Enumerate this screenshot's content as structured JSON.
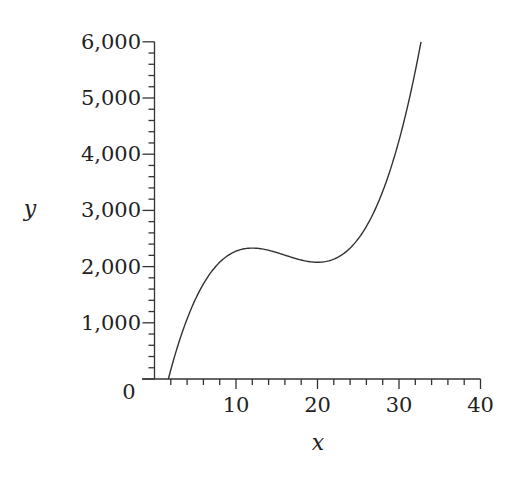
{
  "chart_data": {
    "type": "line",
    "title": "",
    "xlabel": "x",
    "ylabel": "y",
    "xlim": [
      0,
      40
    ],
    "ylim": [
      0,
      6000
    ],
    "grid": false,
    "legend": null,
    "x_ticks": [
      10,
      20,
      30,
      40
    ],
    "x_tick_labels": [
      "10",
      "20",
      "30",
      "40"
    ],
    "x_minor_step": 2,
    "y_ticks": [
      0,
      1000,
      2000,
      3000,
      4000,
      5000,
      6000
    ],
    "y_tick_labels": [
      "0",
      "1,000",
      "2,000",
      "3,000",
      "4,000",
      "5,000",
      "6,000"
    ],
    "y_minor_step": 200,
    "origin_label": "0",
    "series": [
      {
        "name": "y",
        "color": "#333333",
        "x": [
          1.7,
          3,
          5,
          7,
          9,
          11,
          12,
          13,
          15,
          17,
          19,
          20,
          21,
          23,
          25,
          27,
          29,
          31,
          32.7
        ],
        "values": [
          0,
          880,
          1660,
          2090,
          2310,
          2390,
          2400,
          2390,
          2330,
          2240,
          2170,
          2150,
          2160,
          2320,
          2650,
          3100,
          3820,
          4900,
          6000
        ]
      }
    ]
  }
}
